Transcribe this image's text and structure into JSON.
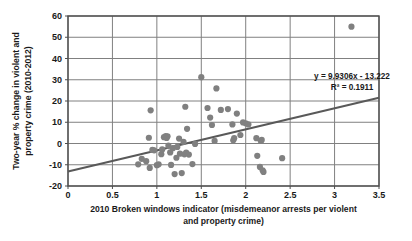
{
  "chart_data": {
    "type": "scatter",
    "title": "",
    "xlabel": "2010 Broken windows indicator (misdemeanor arrests per violent and property crime)",
    "xlabel_line1": "2010 Broken windows indicator (misdemeanor arrests per violent",
    "xlabel_line2": "and property crime)",
    "ylabel": "Two-year % change in violent and property crime (2010-2012)",
    "ylabel_line1": "Two-year % change in violent and",
    "ylabel_line2": "property crime (2010-2012)",
    "xlim": [
      0,
      3.5
    ],
    "ylim": [
      -20,
      60
    ],
    "xticks": [
      "0",
      "0.5",
      "1",
      "1.5",
      "2",
      "2.5",
      "3",
      "3.5"
    ],
    "xtick_values": [
      0,
      0.5,
      1,
      1.5,
      2,
      2.5,
      3,
      3.5
    ],
    "yticks": [
      "60",
      "50",
      "40",
      "30",
      "20",
      "10",
      "0",
      "-10",
      "-20"
    ],
    "ytick_values": [
      60,
      50,
      40,
      30,
      20,
      10,
      0,
      -10,
      -20
    ],
    "grid": "horizontal-and-vertical",
    "legend": "none",
    "marker_color": "#808080",
    "line_color": "#595959",
    "grid_color": "#808080",
    "annotations": {
      "equation": "y = 9.9306x - 13.222",
      "r_squared": "R² = 0.1911"
    },
    "trendline": {
      "slope": 9.9306,
      "intercept": -13.222
    },
    "points": [
      [
        0.79,
        -9.8
      ],
      [
        0.83,
        -7.2
      ],
      [
        0.88,
        -8.3
      ],
      [
        0.91,
        2.7
      ],
      [
        0.92,
        -11.5
      ],
      [
        0.93,
        15.6
      ],
      [
        0.95,
        -3.0
      ],
      [
        0.97,
        -3.2
      ],
      [
        1.0,
        -10.2
      ],
      [
        1.02,
        -9.8
      ],
      [
        1.05,
        -5.0
      ],
      [
        1.06,
        -2.8
      ],
      [
        1.08,
        3.0
      ],
      [
        1.1,
        3.5
      ],
      [
        1.11,
        2.6
      ],
      [
        1.12,
        3.4
      ],
      [
        1.13,
        -1.0
      ],
      [
        1.15,
        -4.2
      ],
      [
        1.16,
        -10.1
      ],
      [
        1.18,
        -2.2
      ],
      [
        1.2,
        -14.4
      ],
      [
        1.22,
        -6.7
      ],
      [
        1.23,
        -1.6
      ],
      [
        1.25,
        2.3
      ],
      [
        1.26,
        -4.8
      ],
      [
        1.28,
        -13.9
      ],
      [
        1.3,
        0.8
      ],
      [
        1.31,
        -5.1
      ],
      [
        1.32,
        17.3
      ],
      [
        1.33,
        -4.3
      ],
      [
        1.34,
        6.9
      ],
      [
        1.36,
        -5.2
      ],
      [
        1.4,
        -9.7
      ],
      [
        1.43,
        -0.2
      ],
      [
        1.5,
        31.2
      ],
      [
        1.57,
        16.7
      ],
      [
        1.6,
        12.2
      ],
      [
        1.62,
        8.7
      ],
      [
        1.65,
        1.2
      ],
      [
        1.67,
        25.9
      ],
      [
        1.72,
        15.8
      ],
      [
        1.8,
        16.2
      ],
      [
        1.85,
        9.0
      ],
      [
        1.86,
        1.5
      ],
      [
        1.87,
        2.5
      ],
      [
        1.9,
        14.1
      ],
      [
        1.94,
        4.0
      ],
      [
        1.97,
        9.9
      ],
      [
        2.0,
        9.5
      ],
      [
        2.03,
        9.0
      ],
      [
        2.12,
        2.5
      ],
      [
        2.13,
        -5.8
      ],
      [
        2.16,
        -11.0
      ],
      [
        2.17,
        1.2
      ],
      [
        2.18,
        1.7
      ],
      [
        2.19,
        -12.6
      ],
      [
        2.2,
        -13.4
      ],
      [
        2.41,
        -6.9
      ],
      [
        3.19,
        55.0
      ]
    ]
  }
}
